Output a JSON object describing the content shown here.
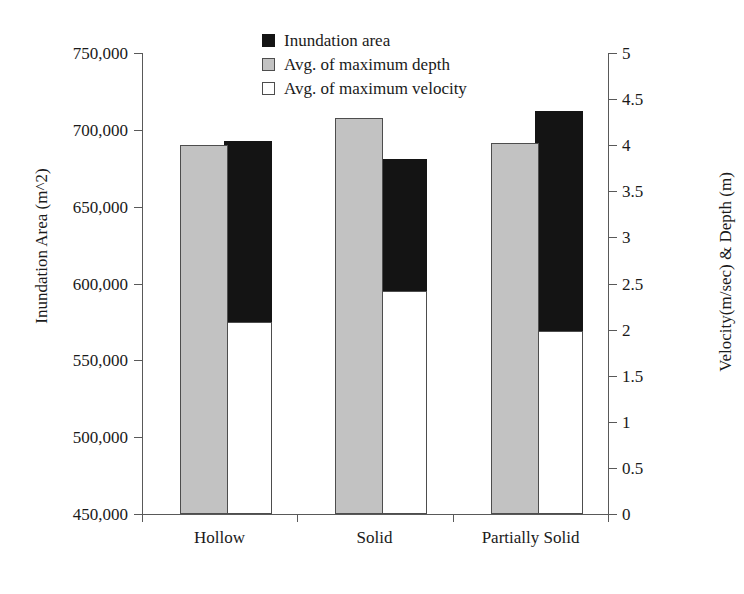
{
  "chart_data": {
    "type": "bar",
    "title": "",
    "categories": [
      "Hollow",
      "Solid",
      "Partially Solid"
    ],
    "series": [
      {
        "name": "Inundation area",
        "axis": "left",
        "color": "#141414",
        "values": [
          693000,
          681000,
          712000
        ]
      },
      {
        "name": "Avg. of maximum depth",
        "axis": "right",
        "color": "#c2c2c2",
        "values": [
          4.0,
          4.3,
          4.02
        ]
      },
      {
        "name": "Avg. of maximum velocity",
        "axis": "right",
        "color": "#ffffff",
        "values": [
          2.08,
          2.42,
          1.99
        ]
      }
    ],
    "xlabel": "",
    "ylabel_left": "Inundation Area (m^2)",
    "ylabel_right": "Velocity(m/sec) & Depth (m)",
    "ylim_left": [
      450000,
      750000
    ],
    "ylim_right": [
      0,
      5
    ],
    "yticks_left": [
      "750,000",
      "700,000",
      "650,000",
      "600,000",
      "550,000",
      "500,000",
      "450,000"
    ],
    "yticks_right": [
      "5",
      "4.5",
      "4",
      "3.5",
      "3",
      "2.5",
      "2",
      "1.5",
      "1",
      "0.5",
      "0"
    ],
    "grid": false,
    "legend_position": "top-center"
  },
  "legend": {
    "items": [
      {
        "label": "Inundation area",
        "swatch": "black"
      },
      {
        "label": "Avg. of maximum depth",
        "swatch": "gray"
      },
      {
        "label": "Avg. of maximum velocity",
        "swatch": "white"
      }
    ]
  }
}
